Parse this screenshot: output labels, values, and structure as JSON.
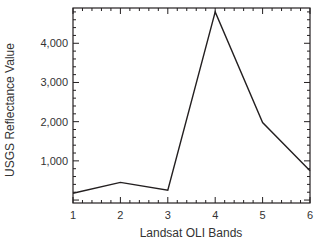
{
  "chart_data": {
    "type": "line",
    "title": "",
    "xlabel": "Landsat OLI Bands",
    "ylabel": "USGS Reflectance Value",
    "x": [
      1,
      2,
      3,
      4,
      5,
      6
    ],
    "series": [
      {
        "name": "Reflectance",
        "values": [
          175,
          450,
          250,
          4800,
          1975,
          750
        ]
      }
    ],
    "xlim": [
      1,
      6
    ],
    "ylim": [
      -75,
      4900
    ],
    "xticks": [
      "1",
      "2",
      "3",
      "4",
      "5",
      "6"
    ],
    "yticks": [
      {
        "value": 1000,
        "label": "1,000"
      },
      {
        "value": 2000,
        "label": "2,000"
      },
      {
        "value": 3000,
        "label": "3,000"
      },
      {
        "value": 4000,
        "label": "4,000"
      }
    ],
    "grid": false,
    "legend": null,
    "line_color": "#231f20",
    "axis_color": "#231f20"
  }
}
